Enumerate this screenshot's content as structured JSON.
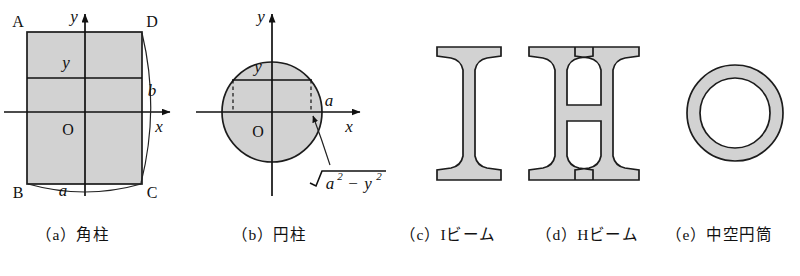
{
  "figure": {
    "background_color": "#ffffff",
    "fill_color": "#d2d2d2",
    "line_color": "#1c1c1c"
  },
  "panels": [
    {
      "id": "a",
      "caption": "（a）角柱",
      "caption_index": "（a）",
      "caption_name": "角柱",
      "shape": "rectangle",
      "axis_labels": {
        "x": "x",
        "y": "y",
        "origin": "O"
      },
      "corner_labels": {
        "top_left": "A",
        "bottom_left": "B",
        "bottom_right": "C",
        "top_right": "D"
      },
      "dimension_labels": {
        "width": "a",
        "height": "b"
      },
      "strip_label": "y"
    },
    {
      "id": "b",
      "caption": "（b）円柱",
      "caption_index": "（b）",
      "caption_name": "円柱",
      "shape": "circle",
      "axis_labels": {
        "x": "x",
        "y": "y",
        "origin": "O"
      },
      "radius_label": "a",
      "strip_label": "y",
      "chord_expression": {
        "radical": "√",
        "base_1": "a",
        "exponent_1": "2",
        "operator": "−",
        "base_2": "y",
        "exponent_2": "2",
        "plain": "√(a²−y²)"
      }
    },
    {
      "id": "c",
      "caption": "（c）Iビーム",
      "caption_index": "（c）",
      "caption_name": "Iビーム",
      "shape": "i-beam"
    },
    {
      "id": "d",
      "caption": "（d）Hビーム",
      "caption_index": "（d）",
      "caption_name": "Hビーム",
      "shape": "h-beam"
    },
    {
      "id": "e",
      "caption": "（e）中空円筒",
      "caption_index": "（e）",
      "caption_name": "中空円筒",
      "shape": "annulus"
    }
  ]
}
